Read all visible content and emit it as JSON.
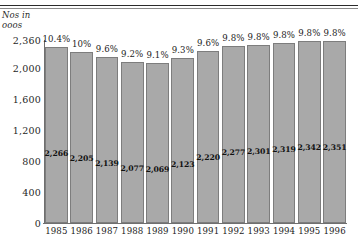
{
  "chart_data": {
    "type": "bar",
    "title": "",
    "xlabel": "",
    "ylabel": "Nos in ooos",
    "categories": [
      "1985",
      "1986",
      "1987",
      "1988",
      "1989",
      "1990",
      "1991",
      "1992",
      "1993",
      "1994",
      "1995",
      "1996"
    ],
    "values": [
      2266,
      2205,
      2139,
      2077,
      2069,
      2123,
      2220,
      2277,
      2301,
      2319,
      2342,
      2351
    ],
    "value_labels": [
      "2,266",
      "2,205",
      "2,139",
      "2,077",
      "2,069",
      "2,123",
      "2,220",
      "2,277",
      "2,301",
      "2,319",
      "2,342",
      "2,351"
    ],
    "percent_labels": [
      "10.4%",
      "10%",
      "9.6%",
      "9.2%",
      "9.1%",
      "9.3%",
      "9.6%",
      "9.8%",
      "9.8%",
      "9.8%",
      "9.8%",
      "9.8%"
    ],
    "percent_values": [
      10.4,
      10,
      9.6,
      9.2,
      9.1,
      9.3,
      9.6,
      9.8,
      9.8,
      9.8,
      9.8,
      9.8
    ],
    "ylim": [
      0,
      2360
    ],
    "ytick_labels": [
      "2,360",
      "2,000",
      "1,600",
      "1,200",
      "800",
      "400",
      "0"
    ],
    "ytick_values": [
      2360,
      2000,
      1600,
      1200,
      800,
      400,
      0
    ],
    "grid": false,
    "legend": "none",
    "colors": {
      "bar_fill": "#a9a9a9",
      "bar_border": "#7d7d7d",
      "axis": "#6f6f6f",
      "text": "#1c1c1c",
      "background": "#ffffff"
    }
  }
}
